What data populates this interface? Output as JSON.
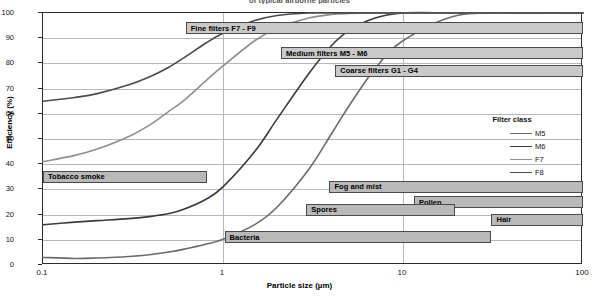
{
  "header": {
    "cut_off_title": "of typical airborne particles"
  },
  "axes": {
    "x_title": "Particle size (µm)",
    "y_title": "Efficiency (%)",
    "x_ticks": [
      "0.1",
      "1",
      "10",
      "100"
    ],
    "y_ticks": [
      "0",
      "10",
      "20",
      "30",
      "40",
      "50",
      "60",
      "70",
      "80",
      "90",
      "100"
    ]
  },
  "legend": {
    "title": "Filter class",
    "items": [
      {
        "label": "M5",
        "color": "#6b6b6b"
      },
      {
        "label": "M6",
        "color": "#3a3a3a"
      },
      {
        "label": "F7",
        "color": "#8f8f8f"
      },
      {
        "label": "F8",
        "color": "#4a4a4a"
      }
    ]
  },
  "filter_bars": [
    {
      "label": "Fine filters  F7 - F9",
      "x_start": 0.62,
      "x_end": 100,
      "y": 94
    },
    {
      "label": "Medium filters  M5 - M6",
      "x_start": 2.1,
      "x_end": 100,
      "y": 84
    },
    {
      "label": "Coarse filters  G1 - G4",
      "x_start": 4.2,
      "x_end": 100,
      "y": 77
    }
  ],
  "particle_bars": [
    {
      "label": "Tobacco smoke",
      "x_start": 0.1,
      "x_end": 0.82,
      "y": 35
    },
    {
      "label": "Fog and mist",
      "x_start": 3.9,
      "x_end": 100,
      "y": 31
    },
    {
      "label": "Pollen",
      "x_start": 11.5,
      "x_end": 100,
      "y": 25
    },
    {
      "label": "Spores",
      "x_start": 2.9,
      "x_end": 19.5,
      "y": 22
    },
    {
      "label": "Hair",
      "x_start": 31,
      "x_end": 100,
      "y": 18
    },
    {
      "label": "Bacteria",
      "x_start": 1.02,
      "x_end": 31,
      "y": 11
    }
  ],
  "chart_data": {
    "type": "line",
    "title": "of typical airborne particles",
    "xlabel": "Particle size (µm)",
    "ylabel": "Efficiency (%)",
    "xscale": "log",
    "xlim": [
      0.1,
      100
    ],
    "ylim": [
      0,
      100
    ],
    "grid": true,
    "legend_position": "inside-right",
    "x": [
      0.1,
      0.15,
      0.2,
      0.3,
      0.4,
      0.5,
      0.6,
      0.8,
      1.0,
      1.5,
      2.0,
      3.0,
      4.0,
      5.0,
      7.0,
      10,
      20,
      50,
      100
    ],
    "series": [
      {
        "name": "M5",
        "color": "#6b6b6b",
        "values": [
          3,
          2.6,
          2.8,
          3.4,
          4.2,
          5.2,
          6.2,
          8.2,
          10.2,
          16,
          23,
          38,
          52,
          63,
          78,
          89,
          99,
          100,
          100
        ]
      },
      {
        "name": "M6",
        "color": "#3a3a3a",
        "values": [
          16,
          17,
          17.6,
          18.4,
          19.3,
          20.4,
          22,
          26,
          31,
          45,
          58,
          76,
          87,
          93,
          98,
          100,
          100,
          100,
          100
        ]
      },
      {
        "name": "F7",
        "color": "#8f8f8f",
        "values": [
          41,
          43.5,
          46,
          51,
          56,
          61,
          65,
          73,
          79,
          89,
          94,
          98,
          99.4,
          99.8,
          100,
          100,
          100,
          100,
          100
        ]
      },
      {
        "name": "F8",
        "color": "#4a4a4a",
        "values": [
          65,
          66.5,
          68,
          71.5,
          75,
          78.5,
          82,
          88,
          92,
          97,
          99,
          100,
          100,
          100,
          100,
          100,
          100,
          100,
          100
        ]
      }
    ],
    "annotation_bars": [
      {
        "label": "Fine filters  F7 - F9",
        "x_range": [
          0.62,
          100
        ],
        "y": 94
      },
      {
        "label": "Medium filters  M5 - M6",
        "x_range": [
          2.1,
          100
        ],
        "y": 84
      },
      {
        "label": "Coarse filters  G1 - G4",
        "x_range": [
          4.2,
          100
        ],
        "y": 77
      },
      {
        "label": "Tobacco smoke",
        "x_range": [
          0.1,
          0.82
        ],
        "y": 35
      },
      {
        "label": "Fog and mist",
        "x_range": [
          3.9,
          100
        ],
        "y": 31
      },
      {
        "label": "Pollen",
        "x_range": [
          11.5,
          100
        ],
        "y": 25
      },
      {
        "label": "Spores",
        "x_range": [
          2.9,
          19.5
        ],
        "y": 22
      },
      {
        "label": "Hair",
        "x_range": [
          31,
          100
        ],
        "y": 18
      },
      {
        "label": "Bacteria",
        "x_range": [
          1.02,
          31
        ],
        "y": 11
      }
    ]
  }
}
